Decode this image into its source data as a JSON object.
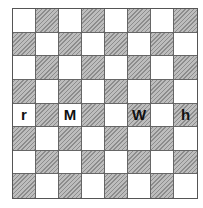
{
  "board": {
    "rows": 8,
    "cols": 8,
    "top_left_color": "light",
    "colors": {
      "light": "#ffffff",
      "dark": "#a9a9a9",
      "grid_line": "#666666"
    },
    "pieces": [
      {
        "row": 4,
        "col": 0,
        "label": "r"
      },
      {
        "row": 4,
        "col": 2,
        "label": "M"
      },
      {
        "row": 4,
        "col": 5,
        "label": "W"
      },
      {
        "row": 4,
        "col": 7,
        "label": "h"
      }
    ]
  }
}
